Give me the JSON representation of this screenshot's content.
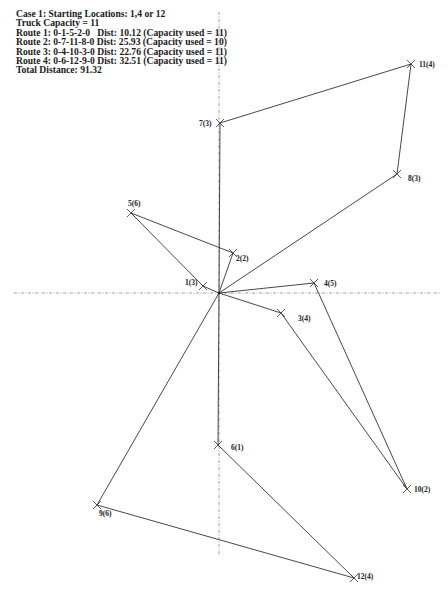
{
  "info": {
    "case": "Case 1: Starting Locations: 1,4 or 12",
    "capacity": "Truck Capacity = 11",
    "routes": [
      "Route 1: 0-1-5-2-0   Dist: 10.12 (Capacity used = 11)",
      "Route 2: 0-7-11-8-0 Dist: 25.93 (Capacity used = 10)",
      "Route 3: 0-4-10-3-0 Dist: 22.76 (Capacity used = 11)",
      "Route 4: 0-6-12-9-0 Dist: 32.51 (Capacity used = 11)"
    ],
    "total": "Total Distance: 91.32"
  },
  "colors": {
    "line": "#333333",
    "axis": "#888888"
  },
  "axes": {
    "horizontal": {
      "x1": 14,
      "x2": 440,
      "y": 293
    },
    "vertical": {
      "x": 219,
      "y1": 12,
      "y2": 556
    }
  },
  "depot": {
    "id": "0",
    "x": 219,
    "y": 293
  },
  "nodes": [
    {
      "id": "1",
      "label": "1(3)",
      "x": 203,
      "y": 286,
      "lx": 185,
      "ly": 285
    },
    {
      "id": "2",
      "label": "2(2)",
      "x": 233,
      "y": 253,
      "lx": 236,
      "ly": 261
    },
    {
      "id": "3",
      "label": "3(4)",
      "x": 281,
      "y": 313,
      "lx": 298,
      "ly": 321
    },
    {
      "id": "4",
      "label": "4(5)",
      "x": 314,
      "y": 283,
      "lx": 324,
      "ly": 286
    },
    {
      "id": "5",
      "label": "5(6)",
      "x": 131,
      "y": 213,
      "lx": 128,
      "ly": 206
    },
    {
      "id": "6",
      "label": "6(1)",
      "x": 218,
      "y": 445,
      "lx": 231,
      "ly": 450
    },
    {
      "id": "7",
      "label": "7(3)",
      "x": 220,
      "y": 123,
      "lx": 199,
      "ly": 126
    },
    {
      "id": "8",
      "label": "8(3)",
      "x": 397,
      "y": 174,
      "lx": 408,
      "ly": 181
    },
    {
      "id": "9",
      "label": "9(6)",
      "x": 97,
      "y": 505,
      "lx": 99,
      "ly": 516
    },
    {
      "id": "10",
      "label": "10(2)",
      "x": 407,
      "y": 489,
      "lx": 414,
      "ly": 492
    },
    {
      "id": "11",
      "label": "11(4)",
      "x": 411,
      "y": 64,
      "lx": 419,
      "ly": 67
    },
    {
      "id": "12",
      "label": "12(4)",
      "x": 354,
      "y": 578,
      "lx": 357,
      "ly": 579
    }
  ],
  "routes": [
    {
      "name": "Route 1",
      "path": [
        "0",
        "1",
        "5",
        "2",
        "0"
      ],
      "distance": 10.12,
      "capacity_used": 11
    },
    {
      "name": "Route 2",
      "path": [
        "0",
        "7",
        "11",
        "8",
        "0"
      ],
      "distance": 25.93,
      "capacity_used": 10
    },
    {
      "name": "Route 3",
      "path": [
        "0",
        "4",
        "10",
        "3",
        "0"
      ],
      "distance": 22.76,
      "capacity_used": 11
    },
    {
      "name": "Route 4",
      "path": [
        "0",
        "6",
        "12",
        "9",
        "0"
      ],
      "distance": 32.51,
      "capacity_used": 11
    }
  ]
}
